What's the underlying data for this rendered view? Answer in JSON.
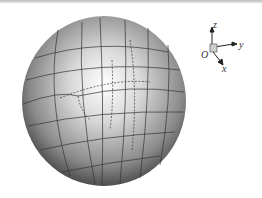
{
  "figure": {
    "axes": {
      "origin_label": "O",
      "x_label": "x",
      "y_label": "y",
      "z_label": "z"
    },
    "colors": {
      "highlight": "#ffffff",
      "shadow": "#3a3a3a",
      "mesh": "#333333"
    }
  }
}
